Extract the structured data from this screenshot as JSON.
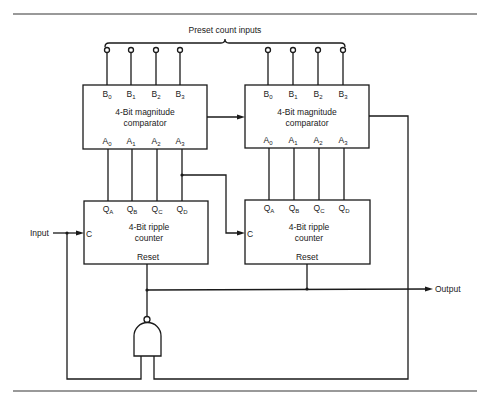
{
  "diagram": {
    "preset_label": "Preset count inputs",
    "input_label": "Input",
    "output_label": "Output",
    "comparator_left": {
      "title_line1": "4-Bit magnitude",
      "title_line2": "comparator",
      "b_pins": [
        "B",
        "B",
        "B",
        "B"
      ],
      "b_subs": [
        "0",
        "1",
        "2",
        "3"
      ],
      "a_pins": [
        "A",
        "A",
        "A",
        "A"
      ],
      "a_subs": [
        "0",
        "1",
        "2",
        "3"
      ]
    },
    "comparator_right": {
      "title_line1": "4-Bit magnitude",
      "title_line2": "comparator",
      "b_pins": [
        "B",
        "B",
        "B",
        "B"
      ],
      "b_subs": [
        "0",
        "1",
        "2",
        "3"
      ],
      "a_pins": [
        "A",
        "A",
        "A",
        "A"
      ],
      "a_subs": [
        "0",
        "1",
        "2",
        "3"
      ]
    },
    "counter_left": {
      "title_line1": "4-Bit ripple",
      "title_line2": "counter",
      "clock_label": "C",
      "reset_label": "Reset",
      "q_pins": [
        "Q",
        "Q",
        "Q",
        "Q"
      ],
      "q_subs": [
        "A",
        "B",
        "C",
        "D"
      ]
    },
    "counter_right": {
      "title_line1": "4-Bit ripple",
      "title_line2": "counter",
      "clock_label": "C",
      "reset_label": "Reset",
      "q_pins": [
        "Q",
        "Q",
        "Q",
        "Q"
      ],
      "q_subs": [
        "A",
        "B",
        "C",
        "D"
      ]
    },
    "gate": "NAND"
  }
}
